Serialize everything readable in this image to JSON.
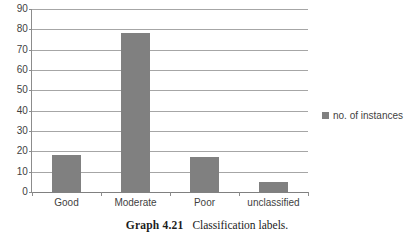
{
  "figure": {
    "caption_number": "Graph 4.21",
    "caption_text": "Classification labels."
  },
  "colors": {
    "bar": "#808080",
    "gridline": "#a6a6a6",
    "axis": "#8c8c8c",
    "text": "#3f3f3f",
    "background": "#ffffff"
  },
  "legend": {
    "position": "right",
    "entries": [
      {
        "label": "no. of instances",
        "color": "#808080",
        "marker": "square-swatch"
      }
    ]
  },
  "chart_data": {
    "type": "bar",
    "title": "",
    "subtitle": "",
    "xlabel": "",
    "ylabel": "",
    "categories": [
      "Good",
      "Moderate",
      "Poor",
      "unclassified"
    ],
    "series": [
      {
        "name": "no. of instances",
        "values": [
          18,
          78,
          17,
          5
        ]
      }
    ],
    "values": [
      18,
      78,
      17,
      5
    ],
    "ylim": [
      0,
      90
    ],
    "ytick_labels": [
      "0",
      "10",
      "20",
      "30",
      "40",
      "50",
      "60",
      "70",
      "80",
      "90"
    ],
    "ytick_values": [
      0,
      10,
      20,
      30,
      40,
      50,
      60,
      70,
      80,
      90
    ],
    "ytick_step": 10,
    "grid": "horizontal",
    "legend_position": "right"
  }
}
